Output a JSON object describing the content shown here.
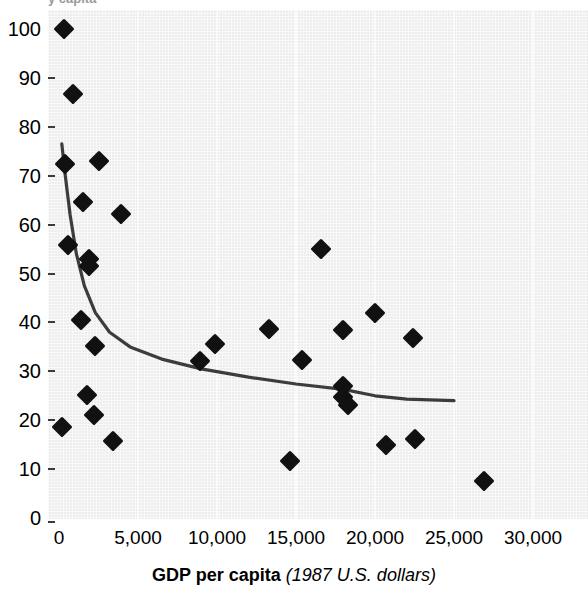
{
  "figure": {
    "top_cut_text": "y capita",
    "axis_title_bold": "GDP per capita",
    "axis_title_italic": "(1987 U.S. dollars)"
  },
  "chart_data": {
    "type": "scatter",
    "title": "",
    "xlabel": "GDP per capita (1987 U.S. dollars)",
    "ylabel": "",
    "xlim": [
      0,
      30000
    ],
    "ylim": [
      0,
      100
    ],
    "xticks": [
      "0",
      "5,000",
      "10,000",
      "15,000",
      "20,000",
      "25,000",
      "30,000"
    ],
    "xtick_values": [
      0,
      5000,
      10000,
      15000,
      20000,
      25000,
      30000
    ],
    "yticks": [
      "0",
      "10",
      "20",
      "30",
      "40",
      "50",
      "60",
      "70",
      "80",
      "90",
      "100"
    ],
    "ytick_values": [
      0,
      10,
      20,
      30,
      40,
      50,
      60,
      70,
      80,
      90,
      100
    ],
    "grid": "vertical-only",
    "legend": "none",
    "marker": "filled-diamond",
    "marker_color": "#111111",
    "plot_background": "#ededed",
    "trend_line_color": "#3c3c3c",
    "points": [
      {
        "x": 300,
        "y": 100.0
      },
      {
        "x": 900,
        "y": 86.8
      },
      {
        "x": 400,
        "y": 72.3
      },
      {
        "x": 1500,
        "y": 64.6
      },
      {
        "x": 2500,
        "y": 73.0
      },
      {
        "x": 3900,
        "y": 62.2
      },
      {
        "x": 600,
        "y": 55.8
      },
      {
        "x": 1900,
        "y": 51.5
      },
      {
        "x": 1900,
        "y": 53.0
      },
      {
        "x": 16600,
        "y": 55.0
      },
      {
        "x": 1400,
        "y": 40.4
      },
      {
        "x": 2300,
        "y": 35.1
      },
      {
        "x": 8900,
        "y": 32.2
      },
      {
        "x": 9900,
        "y": 35.5
      },
      {
        "x": 13300,
        "y": 38.6
      },
      {
        "x": 15400,
        "y": 32.4
      },
      {
        "x": 18000,
        "y": 38.4
      },
      {
        "x": 20000,
        "y": 42.0
      },
      {
        "x": 22400,
        "y": 36.9
      },
      {
        "x": 1800,
        "y": 25.2
      },
      {
        "x": 2200,
        "y": 21.1
      },
      {
        "x": 18000,
        "y": 27.0
      },
      {
        "x": 18000,
        "y": 24.7
      },
      {
        "x": 18300,
        "y": 23.1
      },
      {
        "x": 200,
        "y": 18.6
      },
      {
        "x": 3400,
        "y": 15.7
      },
      {
        "x": 20700,
        "y": 14.9
      },
      {
        "x": 22500,
        "y": 16.2
      },
      {
        "x": 14600,
        "y": 11.7
      },
      {
        "x": 26900,
        "y": 7.6
      }
    ],
    "trend_line": [
      {
        "x": 180,
        "y": 76.5
      },
      {
        "x": 400,
        "y": 70.0
      },
      {
        "x": 700,
        "y": 62.0
      },
      {
        "x": 1100,
        "y": 54.0
      },
      {
        "x": 1600,
        "y": 47.5
      },
      {
        "x": 2300,
        "y": 42.0
      },
      {
        "x": 3200,
        "y": 38.0
      },
      {
        "x": 4500,
        "y": 35.0
      },
      {
        "x": 6500,
        "y": 32.5
      },
      {
        "x": 9000,
        "y": 30.5
      },
      {
        "x": 12000,
        "y": 28.8
      },
      {
        "x": 15000,
        "y": 27.4
      },
      {
        "x": 18000,
        "y": 26.3
      },
      {
        "x": 20000,
        "y": 25.0
      },
      {
        "x": 22000,
        "y": 24.3
      },
      {
        "x": 25000,
        "y": 24.0
      }
    ]
  }
}
